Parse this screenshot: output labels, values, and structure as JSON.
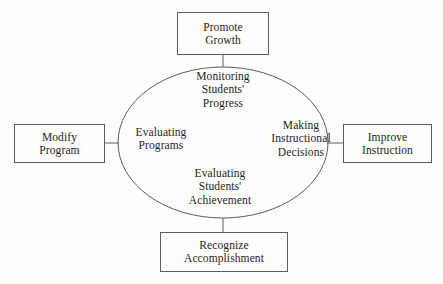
{
  "diagram": {
    "stroke_color": "#5c5c5c",
    "text_color": "#1d1d1d",
    "background_color": "#fdfdfc",
    "center": {
      "shape": "ellipse",
      "phases": [
        {
          "id": "monitoring-students-progress",
          "position": "top",
          "lines": [
            "Monitoring",
            "Students'",
            "Progress"
          ]
        },
        {
          "id": "making-instructional-decisions",
          "position": "right",
          "lines": [
            "Making",
            "Instructional",
            "Decisions"
          ]
        },
        {
          "id": "evaluating-students-achievement",
          "position": "bottom",
          "lines": [
            "Evaluating",
            "Students'",
            "Achievement"
          ]
        },
        {
          "id": "evaluating-programs",
          "position": "left",
          "lines": [
            "Evaluating",
            "Programs"
          ]
        }
      ]
    },
    "outcomes": [
      {
        "id": "promote-growth",
        "position": "top",
        "lines": [
          "Promote",
          "Growth"
        ]
      },
      {
        "id": "improve-instruction",
        "position": "right",
        "lines": [
          "Improve",
          "Instruction"
        ]
      },
      {
        "id": "recognize-accomplishment",
        "position": "bottom",
        "lines": [
          "Recognize",
          "Accomplishment"
        ]
      },
      {
        "id": "modify-program",
        "position": "left",
        "lines": [
          "Modify",
          "Program"
        ]
      }
    ]
  }
}
